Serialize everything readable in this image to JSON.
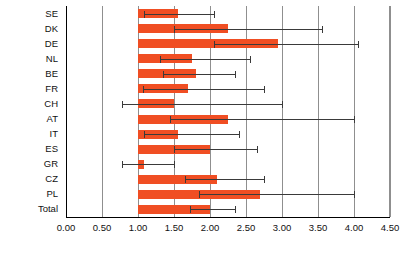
{
  "chart_data": {
    "type": "bar",
    "orientation": "horizontal",
    "title": "",
    "xlabel": "",
    "ylabel": "",
    "xlim": [
      0.0,
      4.5
    ],
    "xticks": [
      "0.00",
      "0.50",
      "1.00",
      "1.50",
      "2.00",
      "2.50",
      "3.00",
      "3.50",
      "4.00",
      "4.50"
    ],
    "xtick_values": [
      0.0,
      0.5,
      1.0,
      1.5,
      2.0,
      2.5,
      3.0,
      3.5,
      4.0,
      4.5
    ],
    "grid": true,
    "legend": "none",
    "baseline": 1.0,
    "bar_color": "#F04E23",
    "error_color": "#3a3a3a",
    "categories": [
      "SE",
      "DK",
      "DE",
      "NL",
      "BE",
      "FR",
      "CH",
      "AT",
      "IT",
      "ES",
      "GR",
      "CZ",
      "PL",
      "Total"
    ],
    "values": [
      1.55,
      2.25,
      2.95,
      1.75,
      1.8,
      1.7,
      1.5,
      2.25,
      1.55,
      2.0,
      1.08,
      2.1,
      2.7,
      2.0
    ],
    "ci_low": [
      1.08,
      1.5,
      2.05,
      1.3,
      1.35,
      1.07,
      0.78,
      1.45,
      1.08,
      1.5,
      0.78,
      1.65,
      1.85,
      1.72
    ],
    "ci_high": [
      2.05,
      3.55,
      4.05,
      2.55,
      2.35,
      2.75,
      3.0,
      4.0,
      2.4,
      2.65,
      1.5,
      2.75,
      4.0,
      2.35
    ],
    "series": [
      {
        "name": "estimate",
        "values": [
          1.55,
          2.25,
          2.95,
          1.75,
          1.8,
          1.7,
          1.5,
          2.25,
          1.55,
          2.0,
          1.08,
          2.1,
          2.7,
          2.0
        ]
      }
    ]
  }
}
